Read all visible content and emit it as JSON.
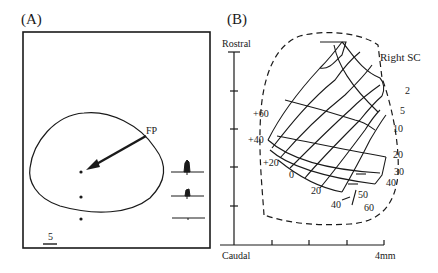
{
  "panel_a": {
    "label": "(A)",
    "fp_label": "FP",
    "scale_bar_label": "5",
    "traces": [
      "strong-response",
      "moderate-response",
      "no-response"
    ],
    "dots": 3
  },
  "panel_b": {
    "label": "(B)",
    "axis_top_label": "Rostral",
    "axis_bottom_left_label": "Caudal",
    "axis_bottom_right_label": "4mm",
    "region_label": "Right SC",
    "elevation_labels": [
      "+60",
      "+40",
      "+20",
      "0",
      "20",
      "40",
      "60"
    ],
    "eccentricity_labels": [
      "2",
      "5",
      "10",
      "20",
      "30",
      "40",
      "50"
    ]
  }
}
